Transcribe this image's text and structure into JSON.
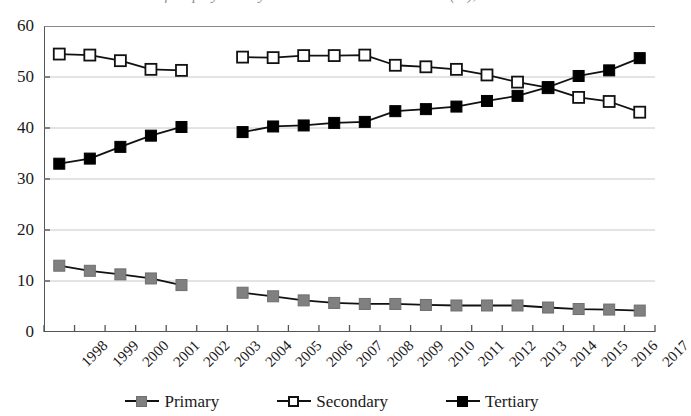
{
  "title": {
    "text": "Share of Employment by Sector in Selected Economies (%), 1998-2017",
    "clipped": true
  },
  "axes": {
    "y_ticks": [
      "60",
      "50",
      "40",
      "30",
      "20",
      "10",
      "0"
    ],
    "x_ticks": [
      "1998",
      "1999",
      "2000",
      "2001",
      "2002",
      "2003",
      "2004",
      "2005",
      "2006",
      "2007",
      "2008",
      "2009",
      "2010",
      "2011",
      "2012",
      "2013",
      "2014",
      "2015",
      "2016",
      "2017"
    ]
  },
  "legend": {
    "position": "bottom-center",
    "items": [
      {
        "label": "Primary",
        "marker": "filled-square",
        "color": "#808080",
        "line_color": "#111111"
      },
      {
        "label": "Secondary",
        "marker": "hollow-square",
        "color": "#ffffff",
        "line_color": "#111111"
      },
      {
        "label": "Tertiary",
        "marker": "filled-square",
        "color": "#000000",
        "line_color": "#111111"
      }
    ]
  },
  "chart_data": {
    "type": "line",
    "title": "Share of Employment by Sector in Selected Economies (%), 1998-2017",
    "xlabel": "",
    "ylabel": "",
    "ylim": [
      0,
      60
    ],
    "ytick_step": 10,
    "grid": "horizontal",
    "x": [
      "1998",
      "1999",
      "2000",
      "2001",
      "2002",
      "2003",
      "2004",
      "2005",
      "2006",
      "2007",
      "2008",
      "2009",
      "2010",
      "2011",
      "2012",
      "2013",
      "2014",
      "2015",
      "2016",
      "2017"
    ],
    "missing_year": "2003",
    "series": [
      {
        "name": "Primary",
        "color": "#808080",
        "marker": "filled-square",
        "values": [
          13.0,
          12.0,
          11.3,
          10.5,
          9.2,
          null,
          7.7,
          7.0,
          6.2,
          5.7,
          5.5,
          5.5,
          5.3,
          5.2,
          5.2,
          5.2,
          4.8,
          4.5,
          4.4,
          4.2
        ]
      },
      {
        "name": "Secondary",
        "color": "#ffffff",
        "marker": "hollow-square",
        "values": [
          54.5,
          54.3,
          53.2,
          51.5,
          51.3,
          null,
          53.9,
          53.8,
          54.2,
          54.2,
          54.3,
          52.3,
          52.0,
          51.5,
          50.4,
          49.0,
          47.9,
          46.0,
          45.2,
          43.1
        ]
      },
      {
        "name": "Tertiary",
        "color": "#000000",
        "marker": "filled-square",
        "values": [
          33.0,
          34.0,
          36.3,
          38.5,
          40.2,
          null,
          39.2,
          40.3,
          40.5,
          41.0,
          41.2,
          43.3,
          43.7,
          44.2,
          45.3,
          46.3,
          48.0,
          50.2,
          51.3,
          53.7
        ]
      }
    ],
    "annotations": [
      {
        "text": "Secondary and Tertiary series cross near 2014 at about 48",
        "x": "2014",
        "y": 48
      }
    ]
  }
}
